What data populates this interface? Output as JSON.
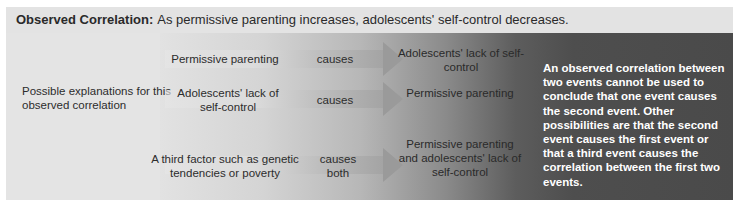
{
  "header": {
    "label": "Observed Correlation:",
    "statement": "As permissive parenting increases, adolescents' self-control decreases."
  },
  "left_label": "Possible explanations for this observed correlation",
  "explanations": [
    {
      "cause": "Permissive parenting",
      "verb": "causes",
      "effect": "Adolescents' lack of self-control"
    },
    {
      "cause": "Adolescents' lack of self-control",
      "verb": "causes",
      "effect": "Permissive parenting"
    },
    {
      "cause": "A third factor such as genetic tendencies or poverty",
      "verb": "causes both",
      "effect": "Permissive parenting and adolescents' lack of self-control"
    }
  ],
  "note": "An observed correlation between two events cannot be used to conclude that one event causes the second event. Other possibilities are that the second event causes the first event or that a third event causes the correlation between the first two events.",
  "colors": {
    "panel_bg": "#e4e4e4",
    "dark_band": "#4a4a4a",
    "note_text": "#ffffff",
    "arrow": "#9a9a9a"
  }
}
